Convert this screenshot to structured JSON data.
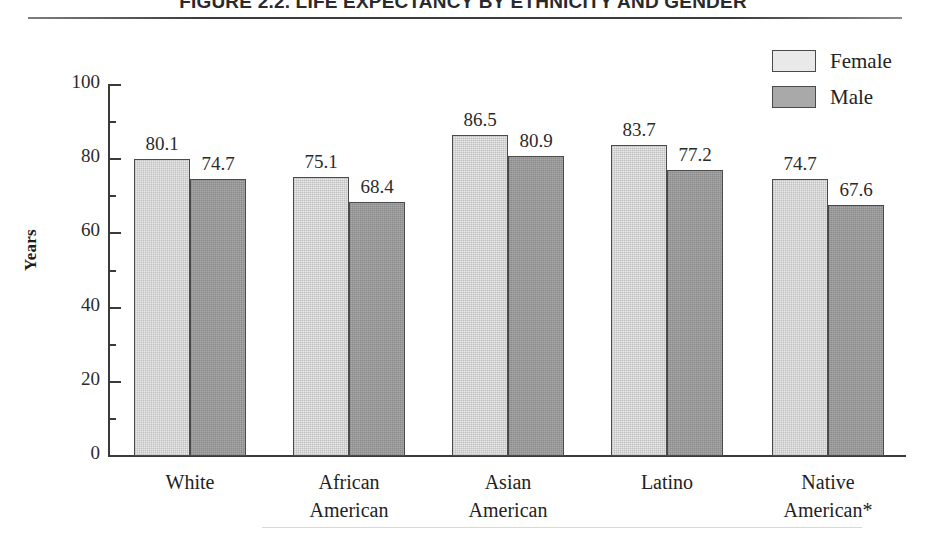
{
  "figure": {
    "title": "FIGURE 2.2. LIFE EXPECTANCY BY ETHNICITY AND GENDER"
  },
  "legend": {
    "female_label": "Female",
    "male_label": "Male",
    "female_color": "#e9e9e9",
    "male_color": "#a9a9a9"
  },
  "axis": {
    "y_title": "Years",
    "ticks": [
      "0",
      "20",
      "40",
      "60",
      "80",
      "100"
    ]
  },
  "chart_data": {
    "type": "bar",
    "title": "FIGURE 2.2. LIFE EXPECTANCY BY ETHNICITY AND GENDER",
    "xlabel": "",
    "ylabel": "Years",
    "ylim": [
      0,
      100
    ],
    "ytick_major": [
      0,
      20,
      40,
      60,
      80,
      100
    ],
    "ytick_minor": [
      10,
      30,
      50,
      70,
      90
    ],
    "grid": false,
    "legend_position": "top-right",
    "categories": [
      "White",
      "African American",
      "Asian American",
      "Latino",
      "Native American*"
    ],
    "category_lines": [
      [
        "White",
        ""
      ],
      [
        "African",
        "American"
      ],
      [
        "Asian",
        "American"
      ],
      [
        "Latino",
        ""
      ],
      [
        "Native",
        "American*"
      ]
    ],
    "series": [
      {
        "name": "Female",
        "color": "#e9e9e9",
        "values": [
          80.1,
          75.1,
          86.5,
          83.7,
          74.7
        ]
      },
      {
        "name": "Male",
        "color": "#a9a9a9",
        "values": [
          74.7,
          68.4,
          80.9,
          77.2,
          67.6
        ]
      }
    ],
    "value_labels": {
      "female": [
        "80.1",
        "75.1",
        "86.5",
        "83.7",
        "74.7"
      ],
      "male": [
        "74.7",
        "68.4",
        "80.9",
        "77.2",
        "67.6"
      ]
    }
  }
}
